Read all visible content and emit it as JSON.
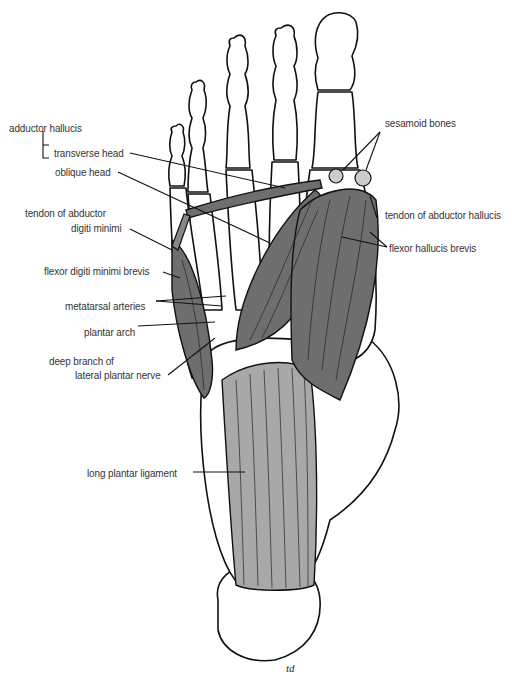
{
  "diagram": {
    "colors": {
      "muscle": "#6e6e6e",
      "ligament": "#a8a8a8",
      "bone": "#ffffff",
      "outline": "#111111",
      "label": "#333333"
    },
    "labels": {
      "adductor_hallucis": "adductor hallucis",
      "transverse_head": "transverse head",
      "oblique_head": "oblique head",
      "tendon_abductor_digiti_minimi_1": "tendon of abductor",
      "tendon_abductor_digiti_minimi_2": "digiti minimi",
      "flexor_digiti_minimi_brevis": "flexor digiti minimi brevis",
      "metatarsal_arteries": "metatarsal arteries",
      "plantar_arch": "plantar arch",
      "deep_branch_1": "deep branch of",
      "deep_branch_2": "lateral plantar nerve",
      "long_plantar_ligament": "long plantar ligament",
      "sesamoid_bones": "sesamoid bones",
      "tendon_abductor_hallucis": "tendon of abductor hallucis",
      "flexor_hallucis_brevis": "flexor hallucis brevis"
    },
    "signature": "td"
  }
}
